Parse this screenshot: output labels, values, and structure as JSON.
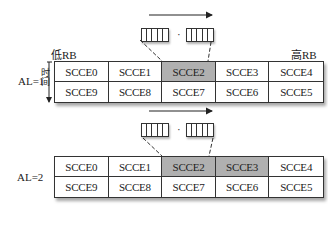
{
  "labels": {
    "low_rb": "低RB",
    "high_rb": "高RB",
    "time_axis": "时间",
    "dots": "·"
  },
  "diagrams": [
    {
      "aggregation_level_label": "AL=1",
      "rows": [
        [
          "SCCE0",
          "SCCE1",
          "SCCE2",
          "SCCE3",
          "SCCE4"
        ],
        [
          "SCCE9",
          "SCCE8",
          "SCCE7",
          "SCCE6",
          "SCCE5"
        ]
      ],
      "highlighted": [
        "SCCE2"
      ]
    },
    {
      "aggregation_level_label": "AL=2",
      "rows": [
        [
          "SCCE0",
          "SCCE1",
          "SCCE2",
          "SCCE3",
          "SCCE4"
        ],
        [
          "SCCE9",
          "SCCE8",
          "SCCE7",
          "SCCE6",
          "SCCE5"
        ]
      ],
      "highlighted": [
        "SCCE2",
        "SCCE3"
      ]
    }
  ],
  "colors": {
    "highlight": "#b0b0b0",
    "border": "#333333"
  }
}
